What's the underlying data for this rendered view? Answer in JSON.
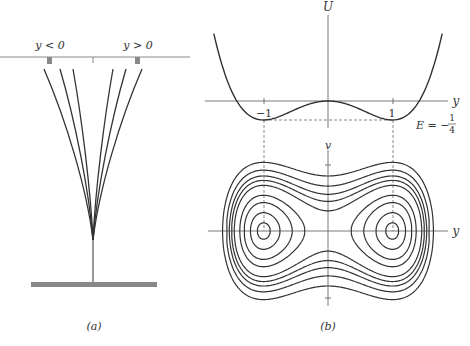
{
  "panel_a": {
    "caption": "(a)",
    "label_left": "y < 0",
    "label_right": "y > 0",
    "curve_count": 6
  },
  "panel_b": {
    "caption": "(b)",
    "potential": {
      "y_axis_label": "U",
      "x_axis_label": "y",
      "tick_minus_one": "−1",
      "tick_one": "1",
      "energy_label": "E = −",
      "energy_frac_num": "1",
      "energy_frac_den": "4",
      "formula": "U(y) = y^4/4 - y^2/2",
      "minima": [
        [
          -1,
          -0.25
        ],
        [
          1,
          -0.25
        ]
      ]
    },
    "phase_plane": {
      "y_axis_label": "v",
      "x_axis_label": "y",
      "inner_levels": [
        -0.24,
        -0.2,
        -0.13,
        -0.06
      ],
      "outer_levels": [
        0.06,
        0.13,
        0.2,
        0.3,
        0.45
      ]
    }
  }
}
